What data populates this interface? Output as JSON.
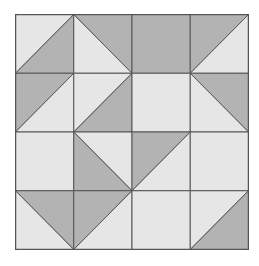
{
  "diagram": {
    "title": "",
    "type": "quilt-block-grid",
    "rows": 4,
    "cols": 4,
    "colors": {
      "light": "#e6e6e6",
      "dark": "#b3b3b3",
      "line": "#555555",
      "background": "#ffffff"
    },
    "cell_legend": {
      "L": "solid light square",
      "D": "solid dark square",
      "TL-dark-BLTR": "diagonal bottom-left to top-right, top-left triangle dark",
      "BR-dark-BLTR": "diagonal bottom-left to top-right, bottom-right triangle dark",
      "TR-dark-TLBR": "diagonal top-left to bottom-right, top-right triangle dark",
      "BL-dark-TLBR": "diagonal top-left to bottom-right, bottom-left triangle dark"
    },
    "cells": [
      [
        "BR-dark-BLTR",
        "TR-dark-TLBR",
        "D",
        "TL-dark-BLTR"
      ],
      [
        "TL-dark-BLTR",
        "BR-dark-BLTR",
        "L",
        "TR-dark-TLBR"
      ],
      [
        "L",
        "BL-dark-TLBR",
        "TL-dark-TRBL",
        "L"
      ],
      [
        "TR-dark-TLBR",
        "TL-dark-TRBL",
        "L",
        "BR-dark-BLTR"
      ]
    ]
  }
}
